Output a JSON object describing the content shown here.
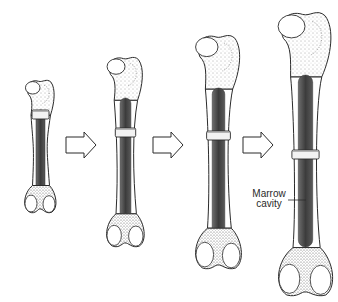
{
  "diagram": {
    "stages": [
      {
        "id": "stage-1",
        "name": "bone-stage-1",
        "relative_size": "smallest"
      },
      {
        "id": "stage-2",
        "name": "bone-stage-2",
        "relative_size": "small"
      },
      {
        "id": "stage-3",
        "name": "bone-stage-3",
        "relative_size": "large"
      },
      {
        "id": "stage-4",
        "name": "bone-stage-4",
        "relative_size": "largest"
      }
    ],
    "arrows": [
      {
        "from": "stage-1",
        "to": "stage-2",
        "direction": "right"
      },
      {
        "from": "stage-2",
        "to": "stage-3",
        "direction": "right"
      },
      {
        "from": "stage-3",
        "to": "stage-4",
        "direction": "right"
      }
    ],
    "labels": {
      "marrow_line1": "Marrow",
      "marrow_line2": "cavity"
    },
    "colors": {
      "outline": "#2b2b2b",
      "bone_fill": "#ffffff",
      "marrow_fill": "#4a4a4a",
      "stipple": "#6a6a6a",
      "band_fill": "#f2f2f2",
      "background": "#ffffff"
    }
  }
}
